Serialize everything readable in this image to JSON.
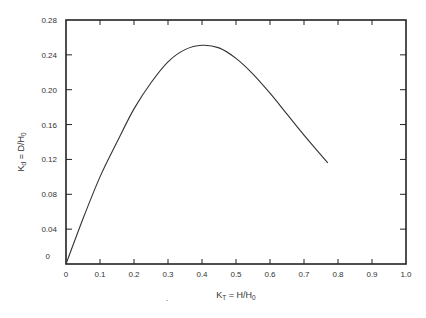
{
  "chart_data": {
    "type": "line",
    "title": "",
    "xlabel": "K_T = H/H_0",
    "ylabel": "K_d = D/H_0",
    "xlabel_parts": {
      "main": "K",
      "sub": "T",
      "rest": " = H/H",
      "rest_sub": "0"
    },
    "ylabel_parts": {
      "main": "K",
      "sub": "d",
      "rest": " = D/H",
      "rest_sub": "0"
    },
    "xlim": [
      0,
      1.0
    ],
    "ylim": [
      0,
      0.28
    ],
    "x_ticks": [
      "0",
      "0.1",
      "0.2",
      "0.3",
      "0.4",
      "0.5",
      "0.6",
      "0.7",
      "0.8",
      "0.9",
      "1.0"
    ],
    "y_ticks": [
      "0",
      "0.04",
      "0.08",
      "0.12",
      "0.16",
      "0.20",
      "0.24",
      "0.28"
    ],
    "grid": false,
    "legend": null,
    "series": [
      {
        "name": "K_d vs K_T",
        "x": [
          0.0,
          0.05,
          0.1,
          0.15,
          0.2,
          0.25,
          0.3,
          0.35,
          0.4,
          0.45,
          0.5,
          0.55,
          0.6,
          0.65,
          0.7,
          0.77
        ],
        "y": [
          0.0,
          0.052,
          0.1,
          0.14,
          0.178,
          0.208,
          0.232,
          0.246,
          0.251,
          0.248,
          0.236,
          0.218,
          0.196,
          0.172,
          0.148,
          0.116
        ]
      }
    ],
    "stray_mark": "."
  }
}
